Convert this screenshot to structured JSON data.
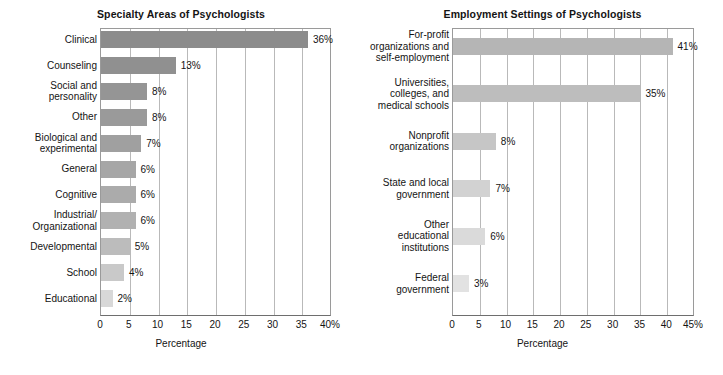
{
  "figure": {
    "background": "#ffffff",
    "width": 723,
    "height": 375
  },
  "charts": [
    {
      "id": "specialty-areas",
      "title": "Specialty Areas of Psychologists",
      "xlabel": "Percentage",
      "tick_labels": [
        "0",
        "5",
        "10",
        "15",
        "20",
        "25",
        "30",
        "35",
        "40%"
      ],
      "rows": [
        {
          "label": "Clinical",
          "value": 36,
          "value_label": "36%",
          "color": "#8c8c8c"
        },
        {
          "label": "Counseling",
          "value": 13,
          "value_label": "13%",
          "color": "#909090"
        },
        {
          "label": "Social and\npersonality",
          "value": 8,
          "value_label": "8%",
          "color": "#959595"
        },
        {
          "label": "Other",
          "value": 8,
          "value_label": "8%",
          "color": "#9a9a9a"
        },
        {
          "label": "Biological and\nexperimental",
          "value": 7,
          "value_label": "7%",
          "color": "#a0a0a0"
        },
        {
          "label": "General",
          "value": 6,
          "value_label": "6%",
          "color": "#a6a6a6"
        },
        {
          "label": "Cognitive",
          "value": 6,
          "value_label": "6%",
          "color": "#ababab"
        },
        {
          "label": "Industrial/\nOrganizational",
          "value": 6,
          "value_label": "6%",
          "color": "#b1b1b1"
        },
        {
          "label": "Developmental",
          "value": 5,
          "value_label": "5%",
          "color": "#bcbcbc"
        },
        {
          "label": "School",
          "value": 4,
          "value_label": "4%",
          "color": "#c9c9c9"
        },
        {
          "label": "Educational",
          "value": 2,
          "value_label": "2%",
          "color": "#d8d8d8"
        }
      ]
    },
    {
      "id": "employment-settings",
      "title": "Employment Settings of Psychologists",
      "xlabel": "Percentage",
      "tick_labels": [
        "0",
        "5",
        "10",
        "15",
        "20",
        "25",
        "30",
        "35",
        "40",
        "45%"
      ],
      "rows": [
        {
          "label": "For-profit\norganizations and\nself-employment",
          "value": 41,
          "value_label": "41%",
          "color": "#b5b5b5"
        },
        {
          "label": "Universities,\ncolleges, and\nmedical schools",
          "value": 35,
          "value_label": "35%",
          "color": "#bdbdbd"
        },
        {
          "label": "Nonprofit\norganizations",
          "value": 8,
          "value_label": "8%",
          "color": "#c6c6c6"
        },
        {
          "label": "State and local\ngovernment",
          "value": 7,
          "value_label": "7%",
          "color": "#d2d2d2"
        },
        {
          "label": "Other\neducational\ninstitutions",
          "value": 6,
          "value_label": "6%",
          "color": "#dadada"
        },
        {
          "label": "Federal\ngovernment",
          "value": 3,
          "value_label": "3%",
          "color": "#e2e2e2"
        }
      ]
    }
  ],
  "chart_data": [
    {
      "type": "bar",
      "orientation": "horizontal",
      "title": "Specialty Areas of Psychologists",
      "xlabel": "Percentage",
      "ylabel": "",
      "xlim": [
        0,
        40
      ],
      "xticks": [
        0,
        5,
        10,
        15,
        20,
        25,
        30,
        35,
        40
      ],
      "xtick_labels": [
        "0",
        "5",
        "10",
        "15",
        "20",
        "25",
        "30",
        "35",
        "40%"
      ],
      "grid": "vertical",
      "legend": "none",
      "categories": [
        "Clinical",
        "Counseling",
        "Social and personality",
        "Other",
        "Biological and experimental",
        "General",
        "Cognitive",
        "Industrial/Organizational",
        "Developmental",
        "School",
        "Educational"
      ],
      "values": [
        36,
        13,
        8,
        8,
        7,
        6,
        6,
        6,
        5,
        4,
        2
      ],
      "data_labels": [
        "36%",
        "13%",
        "8%",
        "8%",
        "7%",
        "6%",
        "6%",
        "6%",
        "5%",
        "4%",
        "2%"
      ]
    },
    {
      "type": "bar",
      "orientation": "horizontal",
      "title": "Employment Settings of Psychologists",
      "xlabel": "Percentage",
      "ylabel": "",
      "xlim": [
        0,
        45
      ],
      "xticks": [
        0,
        5,
        10,
        15,
        20,
        25,
        30,
        35,
        40,
        45
      ],
      "xtick_labels": [
        "0",
        "5",
        "10",
        "15",
        "20",
        "25",
        "30",
        "35",
        "40",
        "45%"
      ],
      "grid": "vertical",
      "legend": "none",
      "categories": [
        "For-profit organizations and self-employment",
        "Universities, colleges, and medical schools",
        "Nonprofit organizations",
        "State and local government",
        "Other educational institutions",
        "Federal government"
      ],
      "values": [
        41,
        35,
        8,
        7,
        6,
        3
      ],
      "data_labels": [
        "41%",
        "35%",
        "8%",
        "7%",
        "6%",
        "3%"
      ]
    }
  ]
}
